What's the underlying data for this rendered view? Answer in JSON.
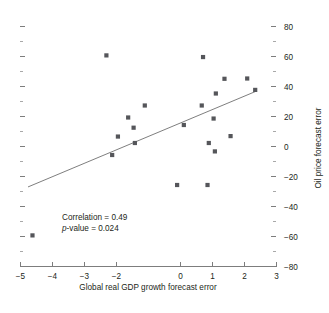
{
  "chart_data": {
    "type": "scatter",
    "title": "",
    "subtitle": "",
    "xlabel": "Global real GDP growth forecast error",
    "ylabel": "Oil price forecast error",
    "xlim": [
      -5,
      3
    ],
    "ylim": [
      -80,
      80
    ],
    "grid": false,
    "legend": null,
    "x_ticks": [
      -5,
      -4,
      -3,
      -2,
      0,
      1,
      2,
      3
    ],
    "x_tick_labels": [
      "-5",
      "-4",
      "-3",
      "-2",
      "0",
      "1",
      "2",
      "3"
    ],
    "y_ticks": [
      80,
      60,
      40,
      20,
      0,
      -20,
      -40,
      -60,
      -80
    ],
    "y_tick_labels": [
      "80",
      "60",
      "40",
      "20",
      "0",
      "-20",
      "-40",
      "-60",
      "-80"
    ],
    "y_minor_ticks": [
      70,
      50,
      30,
      10,
      -10,
      -30,
      -50,
      -70
    ],
    "y_axis_position": "right",
    "marker_shape": "square",
    "marker_color": "#55565a",
    "points": [
      {
        "x": -4.61,
        "y": -59.6
      },
      {
        "x": -2.3,
        "y": 60.4
      },
      {
        "x": -2.12,
        "y": -6.0
      },
      {
        "x": -1.94,
        "y": 6.3
      },
      {
        "x": -1.62,
        "y": 19.0
      },
      {
        "x": -1.45,
        "y": 12.2
      },
      {
        "x": -1.41,
        "y": 2.0
      },
      {
        "x": -1.1,
        "y": 27.0
      },
      {
        "x": -0.09,
        "y": -26.0
      },
      {
        "x": 0.12,
        "y": 14.0
      },
      {
        "x": 0.68,
        "y": 27.0
      },
      {
        "x": 0.72,
        "y": 59.3
      },
      {
        "x": 0.86,
        "y": -26.0
      },
      {
        "x": 0.9,
        "y": 2.0
      },
      {
        "x": 1.05,
        "y": 18.3
      },
      {
        "x": 1.09,
        "y": -3.6
      },
      {
        "x": 1.12,
        "y": 35.0
      },
      {
        "x": 1.39,
        "y": 44.8
      },
      {
        "x": 1.58,
        "y": 6.6
      },
      {
        "x": 2.1,
        "y": 45.0
      },
      {
        "x": 2.35,
        "y": 37.4
      }
    ],
    "fit_line": {
      "x0": -4.75,
      "y0": -27.3,
      "x1": 2.4,
      "y1": 36.7,
      "color": "#6f6f6f"
    },
    "annotations": {
      "correlation_label": "Correlation = 0.49",
      "pvalue_prefix": "p",
      "pvalue_label": "-value = 0.024"
    }
  },
  "colors": {
    "axis": "#7d7d7d",
    "minor_tick": "#a9a9a9",
    "text": "#231f20",
    "marker": "#55565a",
    "background": "#ffffff"
  }
}
